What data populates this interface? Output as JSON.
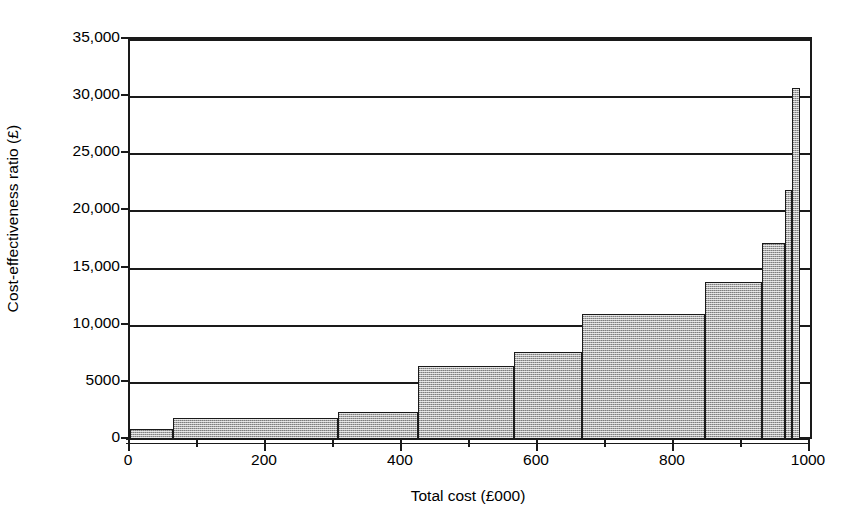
{
  "chart_data": {
    "type": "bar",
    "title": "",
    "subtitle": "",
    "xlabel": "Total cost (£000)",
    "ylabel": "Cost-effectiveness ratio (£)",
    "xlim": [
      0,
      1000
    ],
    "ylim": [
      0,
      35000
    ],
    "grid": true,
    "legend": null,
    "annotations": [],
    "style": {
      "bar_fill_hex": "#aaaaaa",
      "bar_fill_pattern": "grey-dither-checker",
      "bar_edge_hex": "#1a1a1a",
      "axis_hex": "#1a1a1a",
      "background_hex": "#ffffff"
    },
    "y_tick_labels": [
      "0",
      "5000",
      "10,000",
      "15,000",
      "20,000",
      "25,000",
      "30,000",
      "35,000"
    ],
    "y_tick_values": [
      0,
      5000,
      10000,
      15000,
      20000,
      25000,
      30000,
      35000
    ],
    "x_tick_labels": [
      "0",
      "200",
      "400",
      "600",
      "800",
      "1000"
    ],
    "x_tick_values": [
      0,
      200,
      400,
      600,
      800,
      1000
    ],
    "x_minor_tick_values": [
      100,
      300,
      500,
      700,
      900
    ],
    "bars": [
      {
        "x_start": 0,
        "x_end": 63,
        "value": 900
      },
      {
        "x_start": 63,
        "x_end": 306,
        "value": 1840
      },
      {
        "x_start": 306,
        "x_end": 424,
        "value": 2360
      },
      {
        "x_start": 424,
        "x_end": 565,
        "value": 6400
      },
      {
        "x_start": 565,
        "x_end": 665,
        "value": 7650
      },
      {
        "x_start": 665,
        "x_end": 846,
        "value": 10950
      },
      {
        "x_start": 846,
        "x_end": 930,
        "value": 13700
      },
      {
        "x_start": 930,
        "x_end": 963,
        "value": 17150
      },
      {
        "x_start": 963,
        "x_end": 974,
        "value": 21800
      },
      {
        "x_start": 974,
        "x_end": 985,
        "value": 30750
      }
    ]
  }
}
